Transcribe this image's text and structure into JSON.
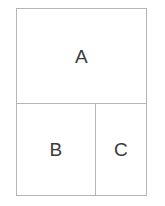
{
  "diagram": {
    "type": "partitioned-rectangle",
    "background_color": "#ffffff",
    "line_color": "#b6b6b6",
    "label_color": "#3a3a3a",
    "line_width_px": 1,
    "outer_rect": {
      "x": 16,
      "y": 8,
      "width": 131,
      "height": 188
    },
    "dividers": [
      {
        "name": "horizontal-divider",
        "orientation": "horizontal",
        "x": 16,
        "y": 103,
        "length": 131
      },
      {
        "name": "vertical-divider",
        "orientation": "vertical",
        "x": 95,
        "y": 103,
        "length": 93
      }
    ],
    "regions": [
      {
        "id": "a",
        "label": "A",
        "x": 16,
        "y": 8,
        "width": 131,
        "height": 95,
        "center_x": 77,
        "center_y": 58
      },
      {
        "id": "b",
        "label": "B",
        "x": 16,
        "y": 103,
        "width": 79,
        "height": 93,
        "center_x": 56,
        "center_y": 150
      },
      {
        "id": "c",
        "label": "C",
        "x": 95,
        "y": 103,
        "width": 52,
        "height": 93,
        "center_x": 120,
        "center_y": 150
      }
    ]
  }
}
